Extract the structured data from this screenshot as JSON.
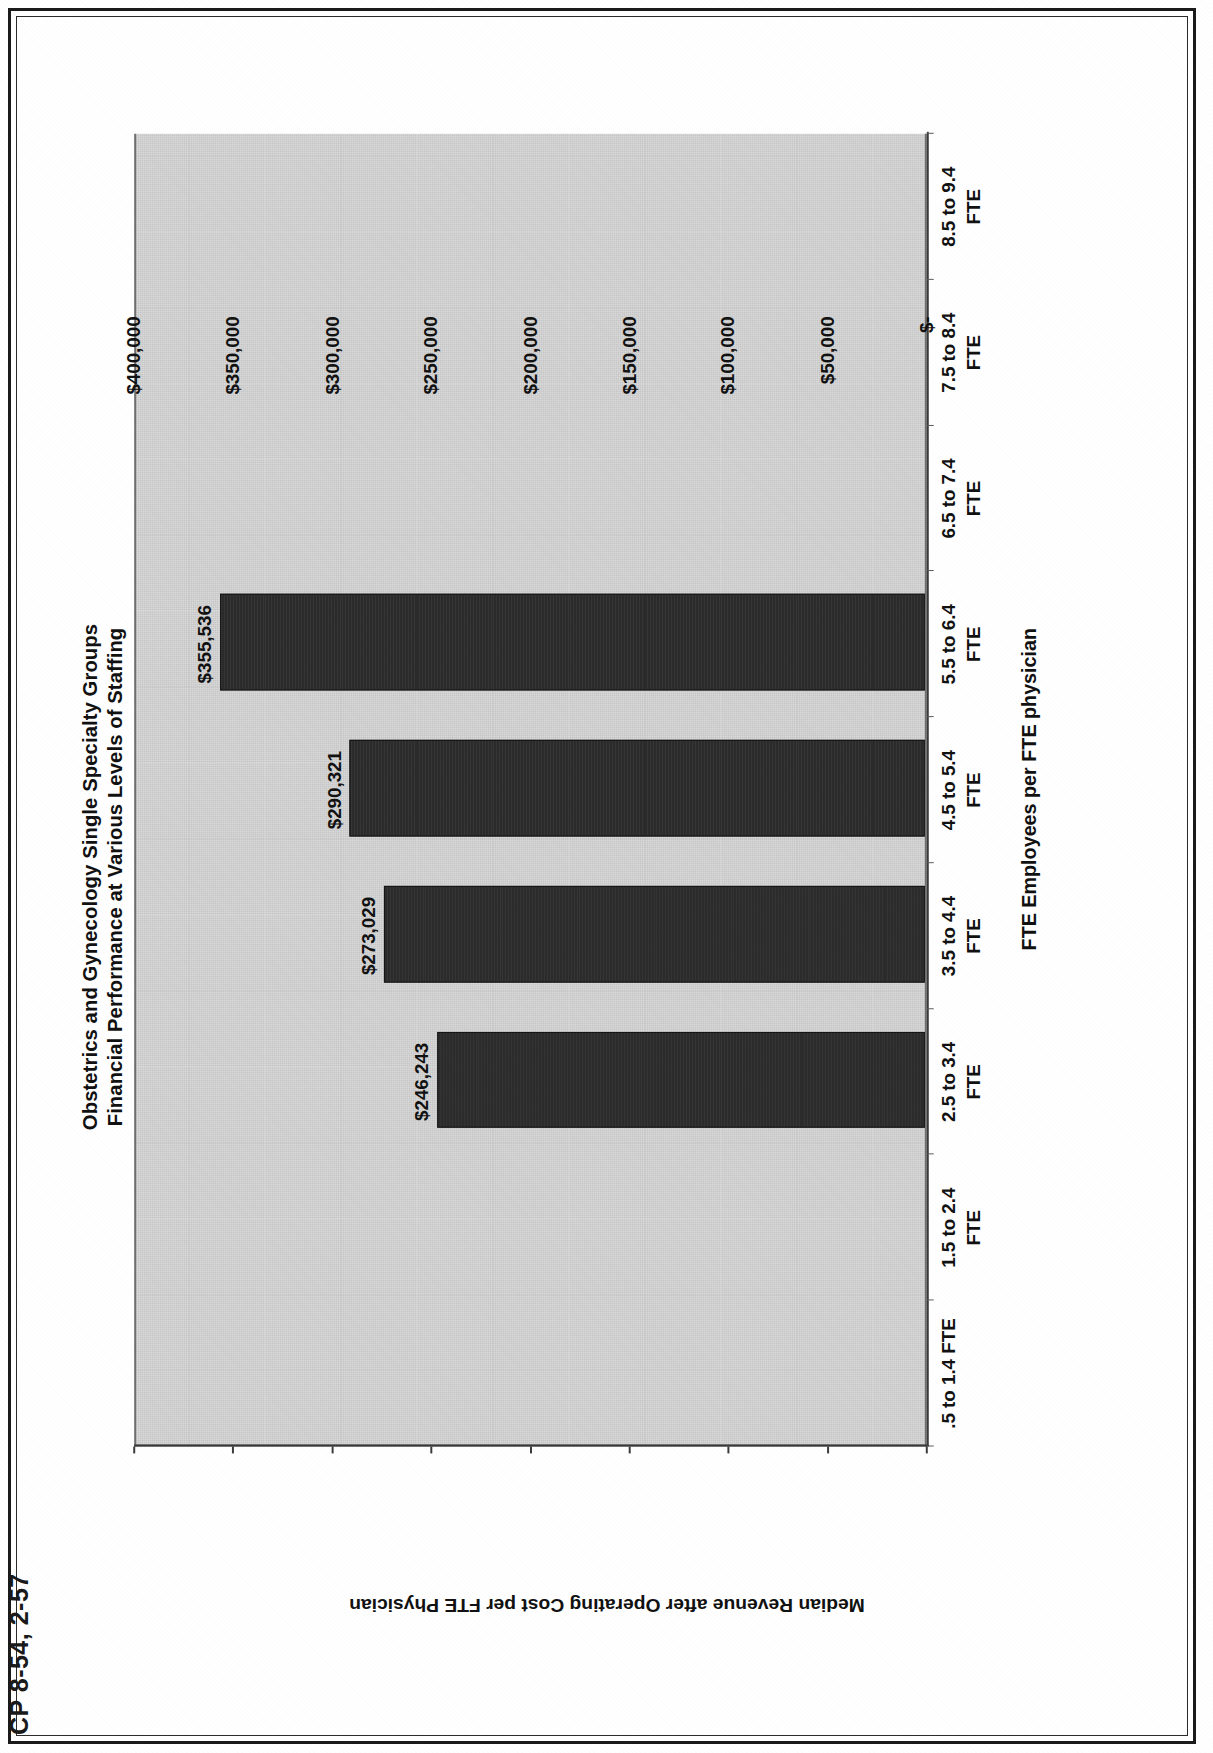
{
  "page": {
    "footer_text": "CP 8-54, 2-57"
  },
  "chart_data": {
    "type": "bar",
    "title": "Obstetrics and Gynecology Single Specialty Groups",
    "subtitle": "Financial Performance at Various Levels of Staffing",
    "xlabel": "FTE Employees per FTE physician",
    "ylabel": "Median Revenue after Operating Cost per FTE Physician",
    "ylim": [
      0,
      400000
    ],
    "ytick_labels": [
      "$400,000",
      "$350,000",
      "$300,000",
      "$250,000",
      "$200,000",
      "$150,000",
      "$100,000",
      "$50,000",
      "$-"
    ],
    "ytick_values": [
      400000,
      350000,
      300000,
      250000,
      200000,
      150000,
      100000,
      50000,
      0
    ],
    "grid": false,
    "legend": "none",
    "categories": [
      ".5 to 1.4 FTE",
      "1.5 to 2.4 FTE",
      "2.5 to 3.4 FTE",
      "3.5 to 4.4 FTE",
      "4.5 to 5.4 FTE",
      "5.5 to 6.4 FTE",
      "6.5 to 7.4 FTE",
      "7.5 to 8.4 FTE",
      "8.5 to 9.4 FTE"
    ],
    "category_lines": [
      [
        ".5 to 1.4 FTE",
        ""
      ],
      [
        "1.5 to 2.4",
        "FTE"
      ],
      [
        "2.5 to 3.4",
        "FTE"
      ],
      [
        "3.5 to 4.4",
        "FTE"
      ],
      [
        "4.5 to 5.4",
        "FTE"
      ],
      [
        "5.5 to 6.4",
        "FTE"
      ],
      [
        "6.5 to 7.4",
        "FTE"
      ],
      [
        "7.5 to 8.4",
        "FTE"
      ],
      [
        "8.5 to 9.4",
        "FTE"
      ]
    ],
    "values": [
      null,
      null,
      246243,
      273029,
      290321,
      355536,
      null,
      null,
      null
    ],
    "value_labels": [
      "",
      "",
      "$246,243",
      "$273,029",
      "$290,321",
      "$355,536",
      "",
      "",
      ""
    ],
    "series": [
      {
        "name": "Median Revenue after Operating Cost per FTE Physician",
        "values": [
          null,
          null,
          246243,
          273029,
          290321,
          355536,
          null,
          null,
          null
        ],
        "color": "#2b2b2b"
      }
    ]
  },
  "colors": {
    "bar": "#2b2b2b",
    "plot_background": "#d9d9d9",
    "axis": "#3a3a3a",
    "text": "#111111",
    "page_background": "#ffffff"
  }
}
